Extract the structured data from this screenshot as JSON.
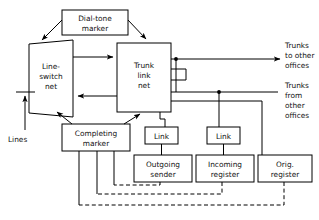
{
  "diagram": {
    "colors": {
      "line": "#000000",
      "box_fill": "#ffffff",
      "background": "#ffffff",
      "text": "#111111"
    },
    "nodes": [
      {
        "id": "dial-tone-marker",
        "shape": "rect",
        "lines": [
          "Dial-tone",
          "marker"
        ]
      },
      {
        "id": "line-switch-net",
        "shape": "trapezoid",
        "lines": [
          "Line-",
          "switch",
          "net"
        ]
      },
      {
        "id": "trunk-link-net",
        "shape": "rect",
        "lines": [
          "Trunk",
          "link",
          "net"
        ]
      },
      {
        "id": "completing-marker",
        "shape": "rect",
        "lines": [
          "Completing",
          "marker"
        ]
      },
      {
        "id": "link-left",
        "shape": "rect",
        "lines": [
          "Link"
        ]
      },
      {
        "id": "link-right",
        "shape": "rect",
        "lines": [
          "Link"
        ]
      },
      {
        "id": "outgoing-sender",
        "shape": "rect",
        "lines": [
          "Outgoing",
          "sender"
        ]
      },
      {
        "id": "incoming-register",
        "shape": "rect",
        "lines": [
          "Incoming",
          "register"
        ]
      },
      {
        "id": "orig-register",
        "shape": "rect",
        "lines": [
          "Orig.",
          "register"
        ]
      }
    ],
    "annotations": [
      {
        "id": "lines",
        "lines": [
          "Lines"
        ]
      },
      {
        "id": "trunks-to-other",
        "lines": [
          "Trunks",
          "to other",
          "offices"
        ]
      },
      {
        "id": "trunks-from-other",
        "lines": [
          "Trunks",
          "from",
          "other",
          "offices"
        ]
      }
    ],
    "node_text": {
      "dial_tone_marker_1": "Dial-tone",
      "dial_tone_marker_2": "marker",
      "line_switch_net_1": "Line-",
      "line_switch_net_2": "switch",
      "line_switch_net_3": "net",
      "trunk_link_net_1": "Trunk",
      "trunk_link_net_2": "link",
      "trunk_link_net_3": "net",
      "completing_marker_1": "Completing",
      "completing_marker_2": "marker",
      "link_left": "Link",
      "link_right": "Link",
      "outgoing_sender_1": "Outgoing",
      "outgoing_sender_2": "sender",
      "incoming_register_1": "Incoming",
      "incoming_register_2": "register",
      "orig_register_1": "Orig.",
      "orig_register_2": "register"
    },
    "annotation_text": {
      "lines": "Lines",
      "trunks_to_1": "Trunks",
      "trunks_to_2": "to other",
      "trunks_to_3": "offices",
      "trunks_from_1": "Trunks",
      "trunks_from_2": "from",
      "trunks_from_3": "other",
      "trunks_from_4": "offices"
    }
  }
}
